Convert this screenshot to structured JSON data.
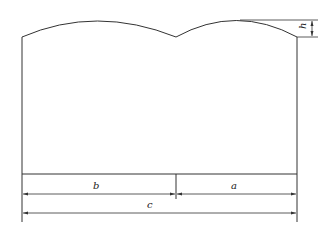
{
  "diagram": {
    "type": "engineering-dimension-drawing",
    "labels": {
      "a": "a",
      "b": "b",
      "c": "c",
      "h": "h"
    },
    "stroke_color": "#333333",
    "background": "#ffffff"
  }
}
